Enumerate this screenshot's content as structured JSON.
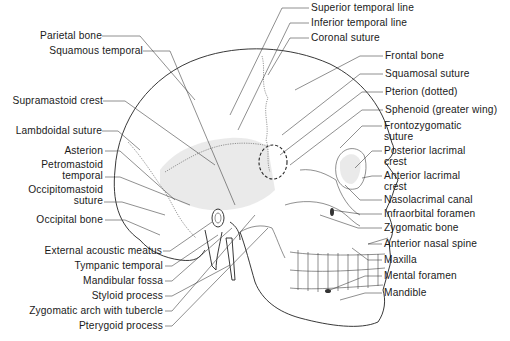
{
  "diagram": {
    "left_labels": [
      {
        "id": "parietal-bone",
        "lines": [
          "Parietal bone"
        ],
        "x": 38,
        "y": 30
      },
      {
        "id": "squamous-temporal",
        "lines": [
          "Squamous temporal"
        ],
        "x": 50,
        "y": 45
      },
      {
        "id": "supramastoid-crest",
        "lines": [
          "Supramastoid crest"
        ],
        "x": 5,
        "y": 95
      },
      {
        "id": "lambdoidal-suture",
        "lines": [
          "Lambdoidal suture"
        ],
        "x": 10,
        "y": 125
      },
      {
        "id": "asterion",
        "lines": [
          "Asterion"
        ],
        "x": 62,
        "y": 145
      },
      {
        "id": "petromastoid-temporal",
        "lines": [
          "Petromastoid",
          "temporal"
        ],
        "x": 37,
        "y": 159
      },
      {
        "id": "occipitomastoid-suture",
        "lines": [
          "Occipitomastoid",
          "suture"
        ],
        "x": 23,
        "y": 185
      },
      {
        "id": "occipital-bone",
        "lines": [
          "Occipital bone"
        ],
        "x": 33,
        "y": 214
      },
      {
        "id": "external-acoustic-meatus",
        "lines": [
          "External acoustic meatus"
        ],
        "x": 39,
        "y": 245
      },
      {
        "id": "tympanic-temporal",
        "lines": [
          "Tympanic temporal"
        ],
        "x": 69,
        "y": 260
      },
      {
        "id": "mandibular-fossa",
        "lines": [
          "Mandibular fossa"
        ],
        "x": 78,
        "y": 275
      },
      {
        "id": "styloid-process",
        "lines": [
          "Styloid process"
        ],
        "x": 86,
        "y": 290
      },
      {
        "id": "zygomatic-arch-with-tubercle",
        "lines": [
          "Zygomatic arch with tubercle"
        ],
        "x": 16,
        "y": 305
      },
      {
        "id": "pterygoid-process",
        "lines": [
          "Pterygoid process"
        ],
        "x": 75,
        "y": 320
      }
    ],
    "right_labels": [
      {
        "id": "superior-temporal-line",
        "lines": [
          "Superior temporal line"
        ],
        "x": 311,
        "y": 2
      },
      {
        "id": "inferior-temporal-line",
        "lines": [
          "Inferior temporal line"
        ],
        "x": 311,
        "y": 17
      },
      {
        "id": "coronal-suture",
        "lines": [
          "Coronal suture"
        ],
        "x": 311,
        "y": 32
      },
      {
        "id": "frontal-bone",
        "lines": [
          "Frontal bone"
        ],
        "x": 385,
        "y": 50
      },
      {
        "id": "squamosal-suture",
        "lines": [
          "Squamosal suture"
        ],
        "x": 385,
        "y": 68
      },
      {
        "id": "pterion-dotted",
        "lines": [
          "Pterion (dotted)"
        ],
        "x": 385,
        "y": 86
      },
      {
        "id": "sphenoid-greater-wing",
        "lines": [
          "Sphenoid (greater wing)"
        ],
        "x": 385,
        "y": 104
      },
      {
        "id": "frontozygomatic-suture",
        "lines": [
          "Frontozygomatic",
          "suture"
        ],
        "x": 384,
        "y": 120
      },
      {
        "id": "posterior-lacrimal-crest",
        "lines": [
          "Posterior lacrimal",
          "crest"
        ],
        "x": 384,
        "y": 145
      },
      {
        "id": "anterior-lacrimal-crest",
        "lines": [
          "Anterior lacrimal",
          "crest"
        ],
        "x": 384,
        "y": 170
      },
      {
        "id": "nasolacrimal-canal",
        "lines": [
          "Nasolacrimal canal"
        ],
        "x": 384,
        "y": 194
      },
      {
        "id": "infraorbital-foramen",
        "lines": [
          "Infraorbital foramen"
        ],
        "x": 384,
        "y": 208
      },
      {
        "id": "zygomatic-bone",
        "lines": [
          "Zygomatic bone"
        ],
        "x": 384,
        "y": 222
      },
      {
        "id": "anterior-nasal-spine",
        "lines": [
          "Anterior nasal spine"
        ],
        "x": 384,
        "y": 238
      },
      {
        "id": "maxilla",
        "lines": [
          "Maxilla"
        ],
        "x": 384,
        "y": 254
      },
      {
        "id": "mental-foramen",
        "lines": [
          "Mental foramen"
        ],
        "x": 384,
        "y": 270
      },
      {
        "id": "mandible",
        "lines": [
          "Mandible"
        ],
        "x": 384,
        "y": 287
      }
    ],
    "colors": {
      "line": "#222222",
      "text": "#1a1a1a",
      "shading": "#d9d9d9",
      "background": "#ffffff"
    }
  }
}
